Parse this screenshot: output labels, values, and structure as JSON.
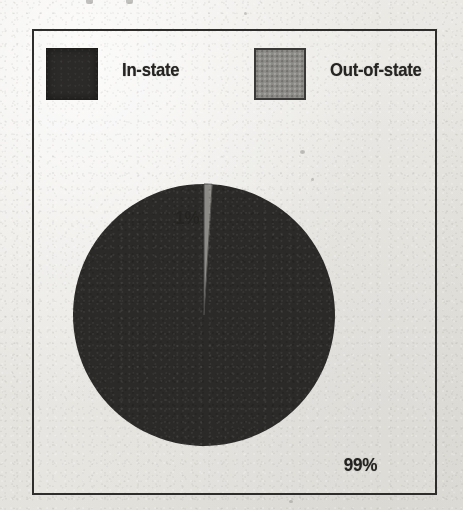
{
  "chart_data": {
    "type": "pie",
    "title": "",
    "labels": [
      "In-state",
      "Out-of-state"
    ],
    "values": [
      99,
      1
    ],
    "value_labels": [
      "99%",
      "1%"
    ],
    "colors": [
      "#2b2a28",
      "#8c8b88"
    ],
    "units": "percent",
    "legend_position": "top",
    "grid": false,
    "start_angle_deg": 0,
    "direction": "clockwise"
  },
  "legend": {
    "items": [
      {
        "label": "In-state",
        "swatch": "dark-square-swatch",
        "color": "#2b2a28"
      },
      {
        "label": "Out-of-state",
        "swatch": "gray-square-swatch",
        "color": "#8c8b88"
      }
    ]
  },
  "pie": {
    "slices": [
      {
        "name": "Out-of-state",
        "value": 1,
        "label": "1%",
        "color": "#8c8b88"
      },
      {
        "name": "In-state",
        "value": 99,
        "label": "99%",
        "color": "#2b2a28"
      }
    ],
    "small_label": "1%",
    "large_label": "99%"
  },
  "colors": {
    "paper": "#e7e5e0",
    "ink": "#2e2d2b",
    "dark_fill": "#2b2a28",
    "gray_fill": "#8c8b88"
  }
}
